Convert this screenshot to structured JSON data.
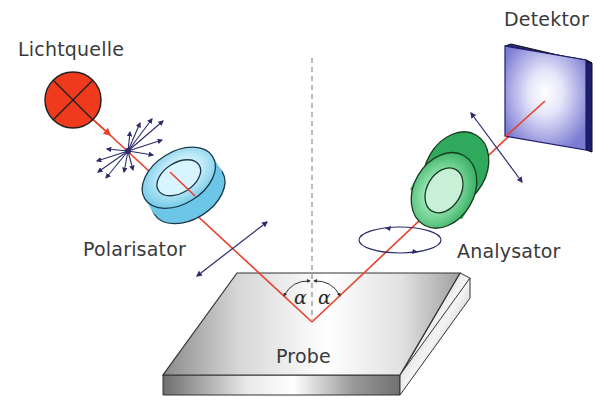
{
  "diagram": {
    "labels": {
      "light_source": "Lichtquelle",
      "polarizer": "Polarisator",
      "analyzer": "Analysator",
      "detector": "Detektor",
      "sample": "Probe",
      "angle_in": "α",
      "angle_out": "α"
    },
    "colors": {
      "beam": "#e8412c",
      "light_source_fill": "#f03a1e",
      "polarizer_fill": "#8fd8f0",
      "analyzer_fill": "#3fbf6f",
      "detector_fill": "#8c8ce0",
      "detector_edge": "#1e1e6e",
      "arrows": "#2b2b6b",
      "sample_fill": "#c8c8c8",
      "text": "#3a3a3a"
    },
    "components": [
      {
        "id": "light_source",
        "icon": "light-source-circle-cross"
      },
      {
        "id": "unpolarized_light",
        "icon": "starburst-arrows"
      },
      {
        "id": "polarizer",
        "icon": "ring-optic"
      },
      {
        "id": "linear_polarization",
        "icon": "double-arrow"
      },
      {
        "id": "sample",
        "icon": "slab"
      },
      {
        "id": "elliptical_polarization",
        "icon": "ellipse-rotation"
      },
      {
        "id": "analyzer",
        "icon": "ring-optic"
      },
      {
        "id": "analyzed_polarization",
        "icon": "double-arrow"
      },
      {
        "id": "detector",
        "icon": "square-plate"
      }
    ]
  }
}
